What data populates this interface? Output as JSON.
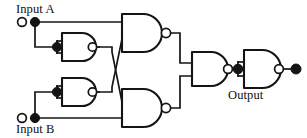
{
  "diagram": {
    "type": "logic-circuit-schematic",
    "background_color": "#ffffff",
    "line_color": "#141414",
    "labels": {
      "input_a": "Input A",
      "input_b": "Input B",
      "output": "Output"
    },
    "terminals": [
      {
        "name": "input-a-terminal",
        "label": "Input A",
        "style": "open-circle",
        "x": 22,
        "y": 22
      },
      {
        "name": "input-b-terminal",
        "label": "Input B",
        "style": "open-circle",
        "x": 22,
        "y": 118
      },
      {
        "name": "output-terminal",
        "label": "Output",
        "style": "filled-dot",
        "x": 295,
        "y": 69
      }
    ],
    "junctions": [
      {
        "name": "input-a-junction",
        "x": 35,
        "y": 22
      },
      {
        "name": "input-b-junction",
        "x": 35,
        "y": 118
      },
      {
        "name": "inverter-1-input-junction",
        "x": 57,
        "y": 47
      },
      {
        "name": "inverter-2-input-junction",
        "x": 57,
        "y": 92
      },
      {
        "name": "inverter-3-input-junction",
        "x": 232,
        "y": 69
      }
    ],
    "gates": [
      {
        "name": "gate-inverter-a",
        "type": "NAND",
        "role": "inverter",
        "inputs_tied": true,
        "label": "NOT A",
        "x": 62,
        "y": 47
      },
      {
        "name": "gate-inverter-b",
        "type": "NAND",
        "role": "inverter",
        "inputs_tied": true,
        "label": "NOT B",
        "x": 62,
        "y": 92
      },
      {
        "name": "gate-nand-top",
        "type": "NAND",
        "role": "logic",
        "inputs_tied": false,
        "label": "A NAND (NOT B)",
        "x": 120,
        "y": 33
      },
      {
        "name": "gate-nand-bottom",
        "type": "NAND",
        "role": "logic",
        "inputs_tied": false,
        "label": "(NOT A) NAND B",
        "x": 120,
        "y": 108
      },
      {
        "name": "gate-nand-combine",
        "type": "NAND",
        "role": "logic",
        "inputs_tied": false,
        "label": "combine",
        "x": 190,
        "y": 69
      },
      {
        "name": "gate-inverter-out",
        "type": "NAND",
        "role": "inverter",
        "inputs_tied": true,
        "label": "output buffer",
        "x": 244,
        "y": 69
      }
    ],
    "connections": [
      {
        "from": "input-a-terminal",
        "to": "gate-nand-top.input-1"
      },
      {
        "from": "input-a-junction",
        "to": "gate-inverter-a.input"
      },
      {
        "from": "input-b-terminal",
        "to": "gate-nand-bottom.input-2"
      },
      {
        "from": "input-b-junction",
        "to": "gate-inverter-b.input"
      },
      {
        "from": "gate-inverter-a.output",
        "to": "gate-nand-bottom.input-1",
        "crossing": true
      },
      {
        "from": "gate-inverter-b.output",
        "to": "gate-nand-top.input-2",
        "crossing": true
      },
      {
        "from": "gate-nand-top.output",
        "to": "gate-nand-combine.input-1"
      },
      {
        "from": "gate-nand-bottom.output",
        "to": "gate-nand-combine.input-2"
      },
      {
        "from": "gate-nand-combine.output",
        "to": "gate-inverter-out.input"
      },
      {
        "from": "gate-inverter-out.output",
        "to": "output-terminal"
      }
    ]
  }
}
